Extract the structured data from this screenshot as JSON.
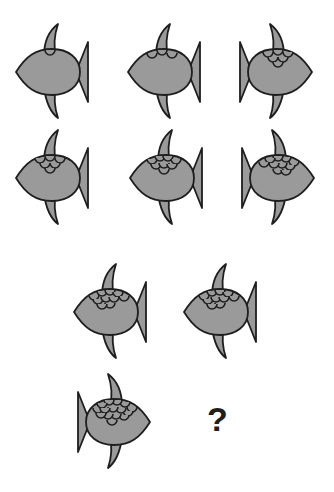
{
  "puzzle": {
    "type": "visual-sequence",
    "colors": {
      "fill": "#9a9a9a",
      "stroke": "#1e1e1e",
      "background": "#ffffff"
    },
    "fish": [
      {
        "id": 1,
        "row": 1,
        "col": 1,
        "facing": "left",
        "scales": 1,
        "x": 10,
        "y": 22
      },
      {
        "id": 2,
        "row": 1,
        "col": 2,
        "facing": "left",
        "scales": 3,
        "x": 122,
        "y": 22
      },
      {
        "id": 3,
        "row": 1,
        "col": 3,
        "facing": "right",
        "scales": 6,
        "x": 238,
        "y": 22
      },
      {
        "id": 4,
        "row": 2,
        "col": 1,
        "facing": "left",
        "scales": 6,
        "x": 10,
        "y": 128
      },
      {
        "id": 5,
        "row": 2,
        "col": 2,
        "facing": "left",
        "scales": 8,
        "x": 124,
        "y": 128
      },
      {
        "id": 6,
        "row": 2,
        "col": 3,
        "facing": "right",
        "scales": 10,
        "x": 240,
        "y": 128
      },
      {
        "id": 7,
        "row": 3,
        "col": 1,
        "facing": "left",
        "scales": 10,
        "x": 68,
        "y": 262
      },
      {
        "id": 8,
        "row": 3,
        "col": 2,
        "facing": "left",
        "scales": 10,
        "x": 178,
        "y": 262
      },
      {
        "id": 9,
        "row": 4,
        "col": 1,
        "facing": "right",
        "scales": 15,
        "x": 76,
        "y": 372
      }
    ],
    "question_mark": {
      "text": "?",
      "x": 207,
      "y": 402
    }
  }
}
